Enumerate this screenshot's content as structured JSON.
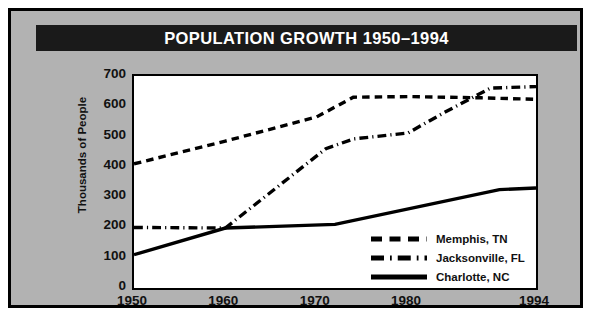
{
  "title": "POPULATION GROWTH 1950–1994",
  "colors": {
    "frame": "#000000",
    "background": "#b2b2b2",
    "title_bar": "#1a1a1a",
    "title_text": "#ffffff",
    "plot_background": "#ffffff",
    "line": "#000000"
  },
  "chart_data": {
    "type": "line",
    "title": "POPULATION GROWTH 1950–1994",
    "xlabel": "",
    "ylabel": "Thousands of People",
    "xlim": [
      1950,
      1994
    ],
    "ylim": [
      0,
      700
    ],
    "yticks": [
      0,
      100,
      200,
      300,
      400,
      500,
      600,
      700
    ],
    "ytick_labels": [
      "0",
      "100",
      "200",
      "300",
      "400",
      "500",
      "600",
      "700"
    ],
    "xticks": [
      1950,
      1960,
      1970,
      1980,
      1994
    ],
    "xtick_labels": [
      "1950",
      "1960",
      "1970",
      "1980",
      "1994"
    ],
    "grid": false,
    "legend_position": "lower right",
    "series": [
      {
        "name": "Memphis, TN",
        "style": "dashed",
        "points": [
          {
            "x": 1950,
            "y": 410
          },
          {
            "x": 1960,
            "y": 485
          },
          {
            "x": 1970,
            "y": 565
          },
          {
            "x": 1974,
            "y": 630
          },
          {
            "x": 1980,
            "y": 632
          },
          {
            "x": 1988,
            "y": 628
          },
          {
            "x": 1994,
            "y": 623
          }
        ]
      },
      {
        "name": "Jacksonville, FL",
        "style": "dash-dot",
        "points": [
          {
            "x": 1950,
            "y": 200
          },
          {
            "x": 1960,
            "y": 198
          },
          {
            "x": 1971,
            "y": 460
          },
          {
            "x": 1974,
            "y": 492
          },
          {
            "x": 1980,
            "y": 512
          },
          {
            "x": 1984,
            "y": 580
          },
          {
            "x": 1989,
            "y": 660
          },
          {
            "x": 1994,
            "y": 665
          }
        ]
      },
      {
        "name": "Charlotte, NC",
        "style": "solid",
        "points": [
          {
            "x": 1950,
            "y": 110
          },
          {
            "x": 1960,
            "y": 198
          },
          {
            "x": 1972,
            "y": 210
          },
          {
            "x": 1990,
            "y": 325
          },
          {
            "x": 1994,
            "y": 330
          }
        ]
      }
    ]
  },
  "legend": {
    "items": [
      {
        "label": "Memphis, TN",
        "style": "dashed"
      },
      {
        "label": "Jacksonville, FL",
        "style": "dash-dot"
      },
      {
        "label": "Charlotte, NC",
        "style": "solid"
      }
    ]
  }
}
